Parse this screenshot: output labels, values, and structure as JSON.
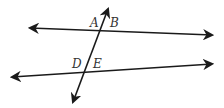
{
  "diagram": {
    "labels": {
      "A": "A",
      "B": "B",
      "D": "D",
      "E": "E"
    },
    "stroke_color": "#1a1a1a",
    "lines": [
      {
        "name": "upper-line",
        "from": [
          30,
          28
        ],
        "to": [
          212,
          35
        ]
      },
      {
        "name": "lower-line",
        "from": [
          12,
          77
        ],
        "to": [
          212,
          64
        ]
      },
      {
        "name": "transversal",
        "from": [
          73,
          102
        ],
        "to": [
          108,
          9
        ]
      }
    ]
  }
}
